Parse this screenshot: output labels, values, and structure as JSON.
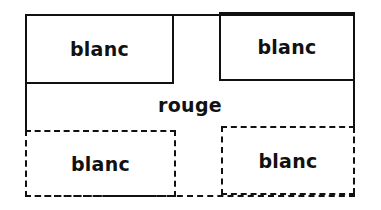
{
  "diagram": {
    "top_left": {
      "label": "blanc",
      "border": "solid"
    },
    "top_right": {
      "label": "blanc",
      "border": "solid"
    },
    "center": {
      "label": "rouge"
    },
    "bottom_left": {
      "label": "blanc",
      "border": "dashed"
    },
    "bottom_right": {
      "label": "blanc",
      "border": "dashed"
    }
  }
}
